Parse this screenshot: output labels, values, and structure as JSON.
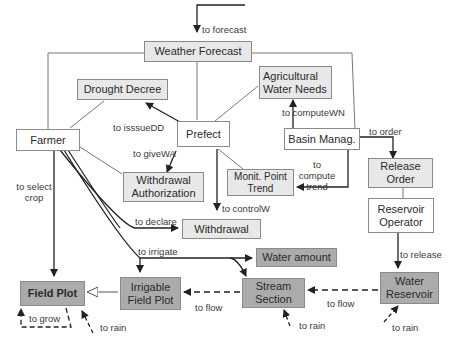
{
  "diagram": {
    "type": "class/association diagram",
    "colors": {
      "white_box": "#ffffff",
      "light_box": "#e8e8e8",
      "dark_box": "#ababab",
      "line": "#555555",
      "arrow": "#222222"
    },
    "nodes": {
      "weather_forecast": "Weather Forecast",
      "drought_decree": "Drought Decree",
      "agricultural_water_needs": "Agricultural Water Needs",
      "farmer": "Farmer",
      "prefect": "Prefect",
      "basin_manag": "Basin Manag.",
      "withdrawal_authorization": "Withdrawal Authorization",
      "monit_point_trend": "Monit. Point Trend",
      "release_order": "Release Order",
      "reservoir_operator": "Reservoir Operator",
      "withdrawal": "Withdrawal",
      "water_amount": "Water amount",
      "field_plot": "Field Plot",
      "irrigable_field_plot": "Irrigable Field Plot",
      "stream_section": "Stream Section",
      "water_reservoir": "Water Reservoir"
    },
    "labels": {
      "to_forecast": "to forecast",
      "to_issueDD": "to isssueDD",
      "to_computeWN": "to computeWN",
      "to_order": "to order",
      "to_giveWA": "to giveWA",
      "to_compute_trend": "to compute trend",
      "to_select_crop": "to select crop",
      "to_controlW": "to controlW",
      "to_declare": "to declare",
      "to_irrigate": "to irrigate",
      "to_release": "to release",
      "to_flow_1": "to flow",
      "to_flow_2": "to flow",
      "to_grow": "to grow",
      "to_rain_1": "to rain",
      "to_rain_2": "to rain",
      "to_rain_3": "to rain"
    }
  }
}
